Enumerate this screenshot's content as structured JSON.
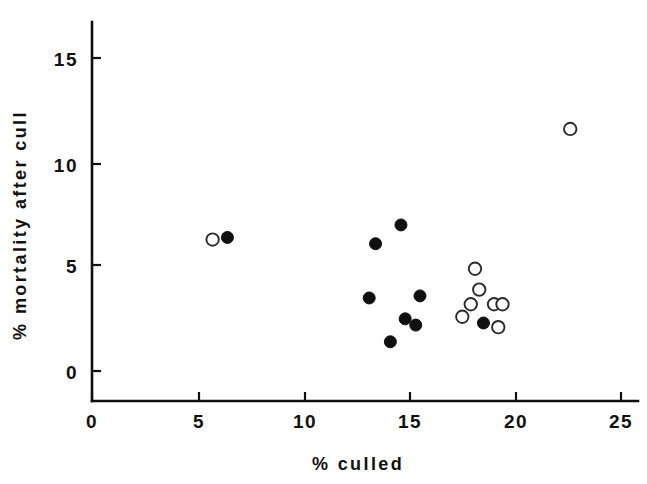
{
  "chart_data": {
    "type": "scatter",
    "title": "",
    "xlabel": "% culled",
    "ylabel": "% mortality after cull",
    "xlim": [
      0,
      26
    ],
    "ylim": [
      0,
      16.5
    ],
    "xticks": [
      0,
      5,
      10,
      15,
      20,
      25
    ],
    "yticks": [
      0,
      5,
      10,
      15
    ],
    "xtick_labels": [
      "0",
      "5",
      "10",
      "15",
      "20",
      "25"
    ],
    "ytick_labels": [
      "0",
      "5",
      "10",
      "15"
    ],
    "grid": false,
    "legend": "none",
    "series": [
      {
        "name": "filled",
        "marker": "filled-circle",
        "color": "#101010",
        "points": [
          {
            "x": 6.4,
            "y": 6.4
          },
          {
            "x": 14.6,
            "y": 7.0
          },
          {
            "x": 13.4,
            "y": 6.1
          },
          {
            "x": 13.1,
            "y": 3.5
          },
          {
            "x": 15.5,
            "y": 3.6
          },
          {
            "x": 14.8,
            "y": 2.5
          },
          {
            "x": 15.3,
            "y": 2.2
          },
          {
            "x": 14.1,
            "y": 1.4
          },
          {
            "x": 18.5,
            "y": 2.3
          }
        ]
      },
      {
        "name": "open",
        "marker": "open-circle",
        "color": "#2a2a2a",
        "points": [
          {
            "x": 5.7,
            "y": 6.3
          },
          {
            "x": 22.6,
            "y": 11.6
          },
          {
            "x": 18.1,
            "y": 4.9
          },
          {
            "x": 18.3,
            "y": 3.9
          },
          {
            "x": 17.9,
            "y": 3.2
          },
          {
            "x": 19.0,
            "y": 3.2
          },
          {
            "x": 19.4,
            "y": 3.2
          },
          {
            "x": 17.5,
            "y": 2.6
          },
          {
            "x": 19.2,
            "y": 2.1
          }
        ]
      }
    ]
  },
  "axes": {
    "x_axis_name": "x-axis",
    "y_axis_name": "y-axis"
  }
}
